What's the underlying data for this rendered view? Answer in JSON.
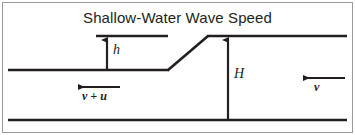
{
  "figure": {
    "title": "Shallow-Water Wave Speed",
    "width": 355,
    "height": 135,
    "background_color": "#ffffff",
    "border_color": "#9a9a9a",
    "stroke_color": "#231f20"
  },
  "labels": {
    "wave_height": "h",
    "water_depth": "H",
    "velocity_left": "v + u",
    "velocity_right": "v"
  },
  "diagram": {
    "seabed_line": {
      "x1": 8,
      "y1": 120,
      "x2": 347,
      "y2": 120
    },
    "upstream_surface_line": {
      "x1": 8,
      "y1": 70,
      "x2": 168,
      "y2": 70
    },
    "wave_front_slope": {
      "x1": 168,
      "y1": 70,
      "x2": 208,
      "y2": 36
    },
    "downstream_surface_line": {
      "x1": 208,
      "y1": 36,
      "x2": 347,
      "y2": 36
    },
    "crest_reference_line": {
      "x1": 96,
      "y1": 36,
      "x2": 168,
      "y2": 36
    },
    "h_arrow": {
      "x": 107,
      "y_tail": 70,
      "y_head": 37,
      "direction": "up"
    },
    "H_arrow": {
      "x": 228,
      "y_tail": 120,
      "y_head": 37,
      "direction": "up"
    },
    "v_plus_u_arrow": {
      "x_tail": 120,
      "x_head": 76,
      "y": 87,
      "direction": "left"
    },
    "v_arrow": {
      "x_tail": 345,
      "x_head": 301,
      "y": 78,
      "direction": "left"
    }
  }
}
